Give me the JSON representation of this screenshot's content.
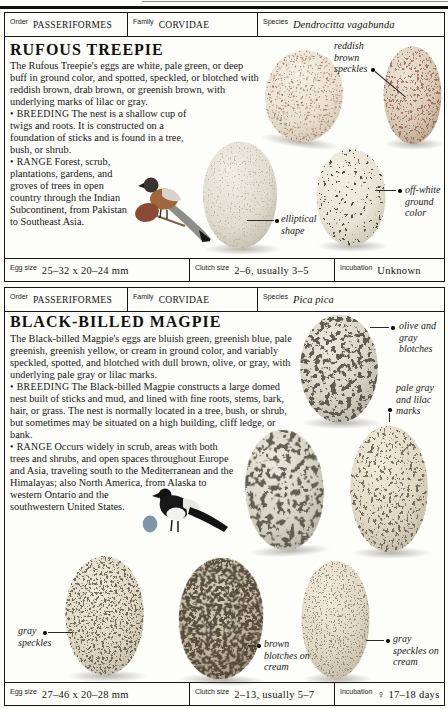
{
  "sections": [
    {
      "header": {
        "order_label": "Order",
        "order_value": "PASSERIFORMES",
        "family_label": "Family",
        "family_value": "CORVIDAE",
        "species_label": "Species",
        "species_value": "Dendrocitta vagabunda"
      },
      "title": "RUFOUS TREEPIE",
      "intro": "The Rufous Treepie's eggs are white, pale green, or deep buff in ground color, and spotted, speckled, or blotched with reddish brown, drab brown, or greenish brown, with underlying marks of lilac or gray.",
      "breeding_keyword": "BREEDING",
      "breeding_text": "The nest is a shallow cup of twigs and roots. It is constructed on a foundation of sticks and is found in a tree, bush, or shrub.",
      "range_keyword": "RANGE",
      "range_text": "Forest, scrub, plantations, gardens, and groves of trees in open country through the Indian Subcontinent, from Pakistan to Southeast Asia.",
      "egg_dot_color": "#8a4a36",
      "annotations": {
        "speckles": "reddish brown speckles",
        "shape": "elliptical shape",
        "ground": "off-white ground color"
      },
      "footer": {
        "egg_size_label": "Egg size",
        "egg_size_value": "25–32 x 20–24 mm",
        "clutch_label": "Clutch size",
        "clutch_value": "2–6, usually 3–5",
        "incubation_label": "Incubation",
        "incubation_value": "Unknown"
      }
    },
    {
      "header": {
        "order_label": "Order",
        "order_value": "PASSERIFORMES",
        "family_label": "Family",
        "family_value": "CORVIDAE",
        "species_label": "Species",
        "species_value": "Pica pica"
      },
      "title": "BLACK-BILLED MAGPIE",
      "intro": "The Black-billed Magpie's eggs are bluish green, greenish blue, pale greenish, greenish yellow, or cream in ground color, and variably speckled, spotted, and blotched with dull brown, olive, or gray, with underlying pale gray or lilac marks.",
      "breeding_keyword": "BREEDING",
      "breeding_text": "The Black-billed Magpie constructs a large domed nest built of sticks and mud, and lined with fine roots, stems, bark, hair, or grass. The nest is normally located in a tree, bush, or shrub, but sometimes may be situated on a high building, cliff ledge, or bank.",
      "range_keyword": "RANGE",
      "range_text": "Occurs widely in scrub, areas with both trees and shrubs, and open spaces throughout Europe and Asia, traveling south to the Mediterranean and the Himalayas; also North America, from Alaska to western Ontario and the southwestern United States.",
      "egg_dot_color": "#7d97a6",
      "annotations": {
        "olive": "olive and gray blotches",
        "palegray": "pale gray and lilac marks",
        "gray": "gray speckles",
        "brown": "brown blotches on cream",
        "graycream": "gray speckles on cream"
      },
      "footer": {
        "egg_size_label": "Egg size",
        "egg_size_value": "27–46 x 20–28 mm",
        "clutch_label": "Clutch size",
        "clutch_value": "2–13, usually 5–7",
        "incubation_label": "Incubation",
        "incubation_value": "♀ 17–18 days"
      }
    }
  ]
}
